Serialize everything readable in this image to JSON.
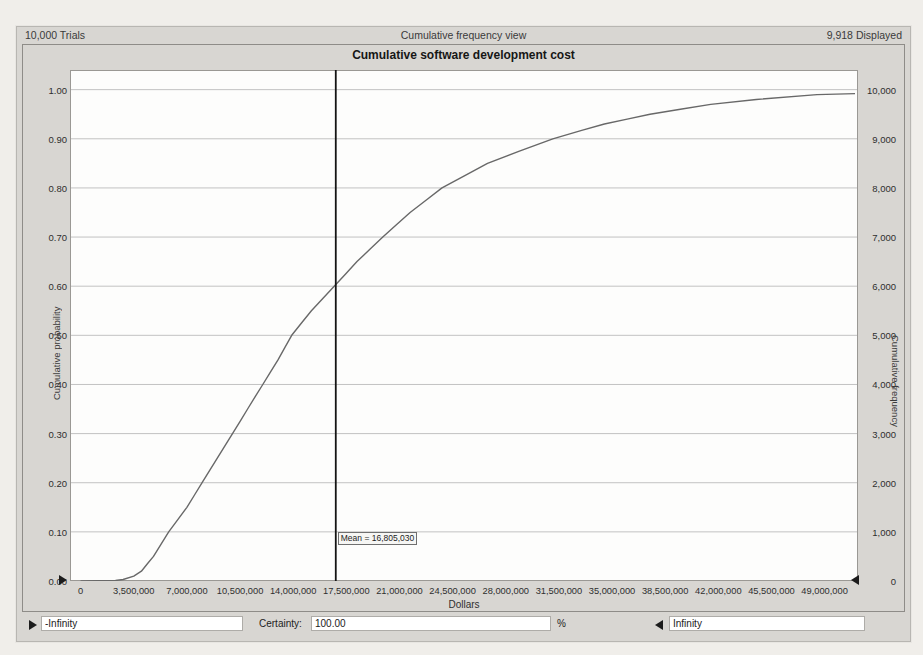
{
  "header": {
    "trials": "10,000 Trials",
    "view_title": "Cumulative frequency view",
    "displayed": "9,918 Displayed"
  },
  "chart_data": {
    "type": "line",
    "title": "Cumulative software development cost",
    "xlabel": "Dollars",
    "ylabel_left": "Cumulative probability",
    "ylabel_right": "Cumulative frequency",
    "trials": 10000,
    "displayed": 9918,
    "xlim": [
      -700000,
      51200000
    ],
    "ylim": [
      0,
      1.04
    ],
    "grid": "horizontal",
    "legend": "none",
    "x_ticks": {
      "values": [
        0,
        3500000,
        7000000,
        10500000,
        14000000,
        17500000,
        21000000,
        24500000,
        28000000,
        31500000,
        35000000,
        38500000,
        42000000,
        45500000,
        49000000
      ],
      "labels": [
        "0",
        "3,500,000",
        "7,000,000",
        "10,500,000",
        "14,000,000",
        "17,500,000",
        "21,000,000",
        "24,500,000",
        "28,000,000",
        "31,500,000",
        "35,000,000",
        "38,500,000",
        "42,000,000",
        "45,500,000",
        "49,000,000"
      ]
    },
    "y_ticks_left": {
      "values": [
        0,
        0.1,
        0.2,
        0.3,
        0.4,
        0.5,
        0.6,
        0.7,
        0.8,
        0.9,
        1.0
      ],
      "labels": [
        "0.00",
        "0.10",
        "0.20",
        "0.30",
        "0.40",
        "0.50",
        "0.60",
        "0.70",
        "0.80",
        "0.90",
        "1.00"
      ]
    },
    "y_ticks_right": {
      "values": [
        0,
        1000,
        2000,
        3000,
        4000,
        5000,
        6000,
        7000,
        8000,
        9000,
        10000
      ],
      "labels": [
        "0",
        "1,000",
        "2,000",
        "3,000",
        "4,000",
        "5,000",
        "6,000",
        "7,000",
        "8,000",
        "9,000",
        "10,000"
      ]
    },
    "curve_points": [
      [
        0,
        0
      ],
      [
        2300000,
        0.001
      ],
      [
        2800000,
        0.003
      ],
      [
        3500000,
        0.01
      ],
      [
        4000000,
        0.02
      ],
      [
        4400000,
        0.035
      ],
      [
        4800000,
        0.05
      ],
      [
        5300000,
        0.075
      ],
      [
        5800000,
        0.1
      ],
      [
        6400000,
        0.125
      ],
      [
        7000000,
        0.15
      ],
      [
        7500000,
        0.175
      ],
      [
        8000000,
        0.2
      ],
      [
        8500000,
        0.225
      ],
      [
        9000000,
        0.25
      ],
      [
        9500000,
        0.275
      ],
      [
        10000000,
        0.3
      ],
      [
        10500000,
        0.325
      ],
      [
        11000000,
        0.35
      ],
      [
        11500000,
        0.375
      ],
      [
        12000000,
        0.4
      ],
      [
        12500000,
        0.425
      ],
      [
        13000000,
        0.45
      ],
      [
        13450000,
        0.475
      ],
      [
        13900000,
        0.5
      ],
      [
        14550000,
        0.525
      ],
      [
        15200000,
        0.55
      ],
      [
        15950000,
        0.575
      ],
      [
        16700000,
        0.6
      ],
      [
        17450000,
        0.625
      ],
      [
        18200000,
        0.65
      ],
      [
        19050000,
        0.675
      ],
      [
        19900000,
        0.7
      ],
      [
        20800000,
        0.725
      ],
      [
        21700000,
        0.75
      ],
      [
        22750000,
        0.775
      ],
      [
        23800000,
        0.8
      ],
      [
        25300000,
        0.825
      ],
      [
        26800000,
        0.85
      ],
      [
        28900000,
        0.875
      ],
      [
        31100000,
        0.9
      ],
      [
        33000000,
        0.917
      ],
      [
        34500000,
        0.93
      ],
      [
        36000000,
        0.94
      ],
      [
        37500000,
        0.95
      ],
      [
        39500000,
        0.96
      ],
      [
        41500000,
        0.97
      ],
      [
        44500000,
        0.98
      ],
      [
        48500000,
        0.99
      ],
      [
        51000000,
        0.992
      ]
    ],
    "mean_marker": {
      "value": 16805030,
      "label": "Mean = 16,805,030"
    },
    "colors": {
      "curve": "#686868",
      "mean_line": "#141414",
      "grid": "#c2c2c2",
      "plot_border": "#9a9894",
      "plot_bg": "#fdfdfc",
      "window_bg": "#d8d6d2",
      "page_bg": "#f0eeea"
    }
  },
  "controls": {
    "lower_bound": "-Infinity",
    "certainty_label": "Certainty:",
    "certainty_value": "100.00",
    "percent_sign": "%",
    "upper_bound": "Infinity"
  }
}
